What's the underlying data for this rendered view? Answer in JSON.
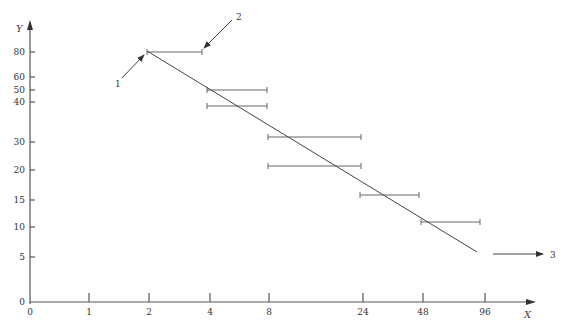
{
  "axes": {
    "y_label": "Y",
    "x_label": "X",
    "y_ticks": [
      {
        "label": "80",
        "y": 52
      },
      {
        "label": "60",
        "y": 77
      },
      {
        "label": "50",
        "y": 90
      },
      {
        "label": "40",
        "y": 102
      },
      {
        "label": "30",
        "y": 142
      },
      {
        "label": "20",
        "y": 170
      },
      {
        "label": "15",
        "y": 200
      },
      {
        "label": "10",
        "y": 227
      },
      {
        "label": "5",
        "y": 257
      },
      {
        "label": "0",
        "y": 302
      }
    ],
    "x_ticks": [
      {
        "label": "0",
        "x": 30
      },
      {
        "label": "1",
        "x": 89
      },
      {
        "label": "2",
        "x": 149
      },
      {
        "label": "4",
        "x": 210
      },
      {
        "label": "8",
        "x": 269
      },
      {
        "label": "24",
        "x": 363
      },
      {
        "label": "48",
        "x": 423
      },
      {
        "label": "96",
        "x": 485
      }
    ]
  },
  "annotations": {
    "label_1": "1",
    "label_2": "2",
    "label_3": "3"
  },
  "chart_data": {
    "type": "scatter",
    "title": "",
    "xlabel": "X",
    "ylabel": "Y",
    "x_ticks": [
      "0",
      "1",
      "2",
      "4",
      "8",
      "24",
      "48",
      "96"
    ],
    "y_ticks": [
      "0",
      "5",
      "10",
      "15",
      "20",
      "30",
      "40",
      "50",
      "60",
      "80"
    ],
    "intervals": [
      {
        "x_from": 2,
        "x_to": 4,
        "y": 80
      },
      {
        "x_from": 4,
        "x_to": 8,
        "y": 50
      },
      {
        "x_from": 4,
        "x_to": 8,
        "y": 40
      },
      {
        "x_from": 8,
        "x_to": 24,
        "y": 32
      },
      {
        "x_from": 8,
        "x_to": 24,
        "y": 20
      },
      {
        "x_from": 24,
        "x_to": 48,
        "y": 15
      },
      {
        "x_from": 48,
        "x_to": 96,
        "y": 11
      }
    ],
    "trend_line": {
      "from": {
        "x": 2,
        "y": 80
      },
      "to": {
        "x": 96,
        "y": 6
      }
    },
    "callouts": [
      "1",
      "2",
      "3"
    ]
  }
}
